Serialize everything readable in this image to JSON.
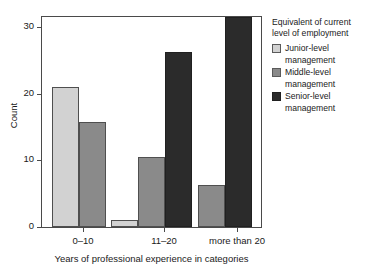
{
  "chart_data": {
    "type": "bar",
    "title": "",
    "xlabel": "Years of professional experience in categories",
    "ylabel": "Count",
    "categories": [
      "0–10",
      "11–20",
      "more than 20"
    ],
    "series": [
      {
        "name": "Junior-level management",
        "values": [
          20,
          1,
          0
        ],
        "color": "#d2d2d2"
      },
      {
        "name": "Middle-level management",
        "values": [
          15,
          10,
          6
        ],
        "color": "#8a8a8a"
      },
      {
        "name": "Senior-level management",
        "values": [
          0,
          25,
          30
        ],
        "color": "#2b2b2b"
      }
    ],
    "ylim": [
      0,
      30
    ],
    "yticks": [
      0,
      10,
      20,
      30
    ],
    "ytick_labels": [
      "0",
      "10",
      "20",
      "30"
    ],
    "grid": false,
    "legend_position": "right",
    "legend_title_line1": "Equivalent of current",
    "legend_title_line2": "level of employment"
  },
  "legend": {
    "title_line1": "Equivalent of current",
    "title_line2": "level of employment",
    "items": [
      {
        "line1": "Junior-level",
        "line2": "management"
      },
      {
        "line1": "Middle-level",
        "line2": "management"
      },
      {
        "line1": "Senior-level",
        "line2": "management"
      }
    ]
  },
  "axes": {
    "y_title": "Count",
    "x_title": "Years of professional experience in categories",
    "y_tick_labels": [
      "0",
      "10",
      "20",
      "30"
    ],
    "x_tick_labels": [
      "0–10",
      "11–20",
      "more than 20"
    ]
  }
}
